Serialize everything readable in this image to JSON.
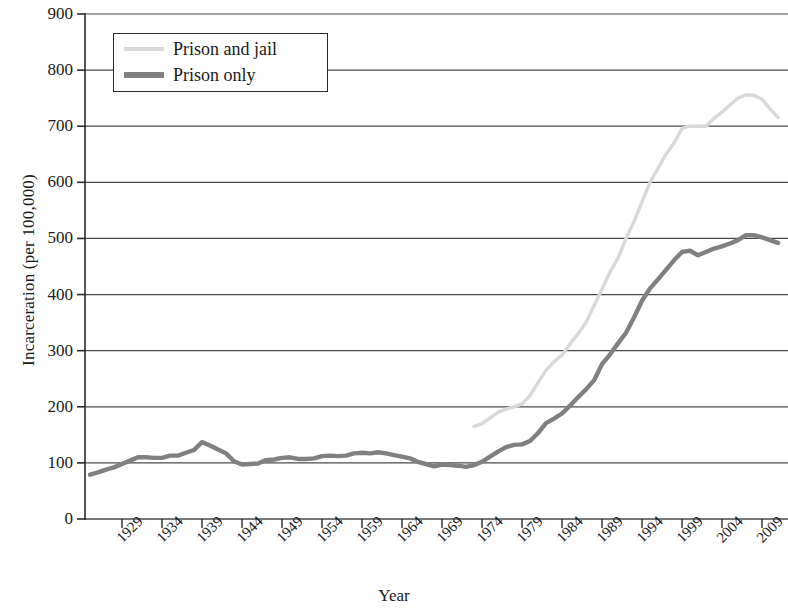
{
  "chart_data": {
    "type": "line",
    "title": "",
    "xlabel": "Year",
    "ylabel": "Incarceration (per 100,000)",
    "xlim": [
      1925,
      2012
    ],
    "ylim": [
      0,
      900
    ],
    "yticks": [
      0,
      100,
      200,
      300,
      400,
      500,
      600,
      700,
      800,
      900
    ],
    "xticks": [
      1929,
      1934,
      1939,
      1944,
      1949,
      1954,
      1959,
      1964,
      1969,
      1974,
      1979,
      1984,
      1989,
      1994,
      1999,
      2004,
      2009
    ],
    "grid": "horizontal",
    "legend_position": "top-left",
    "colors": {
      "prison_and_jail": "#d9d9d9",
      "prison_only": "#808080",
      "axis": "#2a2a2a",
      "grid": "#4a4a4a",
      "text": "#1a1a1a",
      "background": "#ffffff"
    },
    "series": [
      {
        "name": "Prison and jail",
        "color": "#d9d9d9",
        "x": [
          1973,
          1974,
          1975,
          1976,
          1977,
          1978,
          1979,
          1980,
          1981,
          1982,
          1983,
          1984,
          1985,
          1986,
          1987,
          1988,
          1989,
          1990,
          1991,
          1992,
          1993,
          1994,
          1995,
          1996,
          1997,
          1998,
          1999,
          2000,
          2001,
          2002,
          2003,
          2004,
          2005,
          2006,
          2007,
          2008,
          2009,
          2010,
          2011
        ],
        "values": [
          165,
          170,
          180,
          190,
          196,
          200,
          205,
          220,
          243,
          265,
          280,
          292,
          312,
          330,
          350,
          380,
          410,
          440,
          465,
          500,
          530,
          565,
          600,
          625,
          650,
          670,
          696,
          700,
          700,
          700,
          714,
          725,
          738,
          750,
          756,
          755,
          748,
          731,
          716
        ]
      },
      {
        "name": "Prison only",
        "color": "#808080",
        "x": [
          1925,
          1926,
          1927,
          1928,
          1929,
          1930,
          1931,
          1932,
          1933,
          1934,
          1935,
          1936,
          1937,
          1938,
          1939,
          1940,
          1941,
          1942,
          1943,
          1944,
          1945,
          1946,
          1947,
          1948,
          1949,
          1950,
          1951,
          1952,
          1953,
          1954,
          1955,
          1956,
          1957,
          1958,
          1959,
          1960,
          1961,
          1962,
          1963,
          1964,
          1965,
          1966,
          1967,
          1968,
          1969,
          1970,
          1971,
          1972,
          1973,
          1974,
          1975,
          1976,
          1977,
          1978,
          1979,
          1980,
          1981,
          1982,
          1983,
          1984,
          1985,
          1986,
          1987,
          1988,
          1989,
          1990,
          1991,
          1992,
          1993,
          1994,
          1995,
          1996,
          1997,
          1998,
          1999,
          2000,
          2001,
          2002,
          2003,
          2004,
          2005,
          2006,
          2007,
          2008,
          2009,
          2010,
          2011
        ],
        "values": [
          79,
          83,
          88,
          92,
          98,
          104,
          110,
          110,
          109,
          109,
          113,
          113,
          118,
          123,
          137,
          131,
          124,
          117,
          103,
          97,
          98,
          99,
          105,
          106,
          109,
          110,
          107,
          107,
          108,
          112,
          113,
          112,
          113,
          117,
          118,
          117,
          119,
          117,
          114,
          111,
          108,
          102,
          98,
          94,
          97,
          96,
          95,
          93,
          96,
          102,
          111,
          120,
          128,
          132,
          133,
          139,
          153,
          171,
          179,
          188,
          202,
          217,
          231,
          247,
          276,
          293,
          313,
          332,
          359,
          389,
          411,
          427,
          444,
          461,
          476,
          478,
          470,
          476,
          482,
          486,
          491,
          497,
          506,
          506,
          502,
          497,
          492
        ]
      }
    ]
  },
  "legend": {
    "items": [
      {
        "label": "Prison and jail",
        "color": "#d9d9d9"
      },
      {
        "label": "Prison only",
        "color": "#808080"
      }
    ]
  },
  "axes": {
    "y_tick_labels": [
      "900",
      "800",
      "700",
      "600",
      "500",
      "400",
      "300",
      "200",
      "100",
      "0"
    ],
    "x_tick_labels": [
      "1929",
      "1934",
      "1939",
      "1944",
      "1949",
      "1954",
      "1959",
      "1964",
      "1969",
      "1974",
      "1979",
      "1984",
      "1989",
      "1994",
      "1999",
      "2004",
      "2009"
    ],
    "x_axis_title": "Year",
    "y_axis_title": "Incarceration (per 100,000)"
  }
}
